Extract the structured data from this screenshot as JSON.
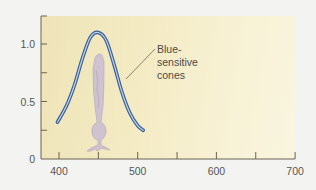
{
  "chart_data": {
    "type": "line",
    "title": "",
    "xlabel": "",
    "ylabel": "",
    "xlim": [
      380,
      700
    ],
    "ylim": [
      0,
      1.2
    ],
    "x_ticks": [
      400,
      450,
      500,
      550,
      600,
      650,
      700
    ],
    "x_tick_labels": [
      "400",
      "500",
      "600",
      "700"
    ],
    "y_ticks": [
      0,
      0.25,
      0.5,
      0.75,
      1.0
    ],
    "y_tick_labels": [
      "0",
      "0.5",
      "1.0"
    ],
    "grid": false,
    "series": [
      {
        "name": "Blue-sensitive cones",
        "color": "#3d5f95",
        "x": [
          398,
          410,
          420,
          430,
          440,
          450,
          460,
          470,
          480,
          490,
          500,
          507
        ],
        "y": [
          0.32,
          0.47,
          0.65,
          0.88,
          1.06,
          1.1,
          1.03,
          0.82,
          0.58,
          0.4,
          0.29,
          0.25
        ]
      }
    ],
    "annotations": [
      {
        "text": "Blue-sensitive cones",
        "lines": [
          "Blue-",
          "sensitive",
          "cones"
        ]
      }
    ],
    "illustration": "cone-photoreceptor-cell"
  }
}
